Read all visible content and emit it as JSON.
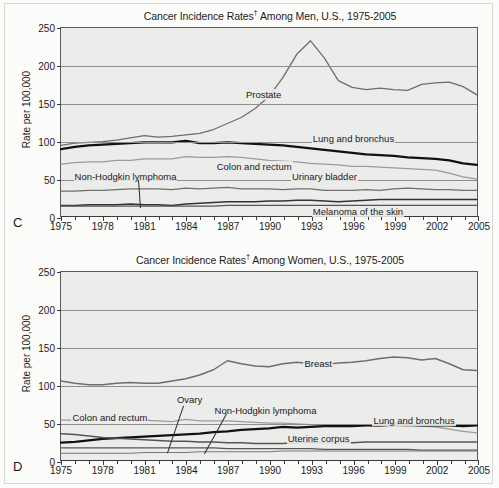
{
  "figure": {
    "background": "#fbfbfa",
    "plot_background": "#ececeb"
  },
  "panels": [
    {
      "panel_label": "C",
      "title_main": "Cancer Incidence Rates",
      "title_dagger": "†",
      "title_rest": " Among Men, U.S., 1975-2005",
      "ylabel": "Rate per 100,000"
    },
    {
      "panel_label": "D",
      "title_main": "Cancer Incidence Rates",
      "title_dagger": "†",
      "title_rest": " Among Women, U.S., 1975-2005",
      "ylabel": "Rate per 100,000"
    }
  ],
  "axis": {
    "yticks": [
      0,
      50,
      100,
      150,
      200,
      250
    ],
    "ylim": [
      0,
      250
    ],
    "xticks": [
      1975,
      1978,
      1981,
      1984,
      1987,
      1990,
      1993,
      1996,
      1999,
      2002,
      2005
    ],
    "xlim": [
      1975,
      2005
    ],
    "xminor_step": 1
  },
  "chart_data": [
    {
      "type": "line",
      "panel": "C",
      "title": "Cancer Incidence Rates† Among Men, U.S., 1975-2005",
      "xlabel": "",
      "ylabel": "Rate per 100,000",
      "xlim": [
        1975,
        2005
      ],
      "ylim": [
        0,
        250
      ],
      "grid": true,
      "legend": "inline-annotations",
      "x": [
        1975,
        1976,
        1977,
        1978,
        1979,
        1980,
        1981,
        1982,
        1983,
        1984,
        1985,
        1986,
        1987,
        1988,
        1989,
        1990,
        1991,
        1992,
        1993,
        1994,
        1995,
        1996,
        1997,
        1998,
        1999,
        2000,
        2001,
        2002,
        2003,
        2004,
        2005
      ],
      "series": [
        {
          "name": "Prostate",
          "color": "#6e6e6e",
          "width": 1.3,
          "values": [
            94,
            97,
            98,
            99,
            101,
            104,
            107,
            105,
            106,
            108,
            110,
            115,
            123,
            131,
            143,
            159,
            184,
            215,
            233,
            210,
            180,
            171,
            168,
            170,
            168,
            167,
            175,
            177,
            178,
            172,
            161
          ]
        },
        {
          "name": "Lung and bronchus",
          "color": "#111111",
          "width": 2.2,
          "values": [
            89,
            92,
            94,
            95,
            96,
            97,
            98,
            98,
            98,
            100,
            97,
            97,
            98,
            97,
            96,
            95,
            94,
            92,
            90,
            88,
            86,
            84,
            82,
            81,
            80,
            78,
            77,
            76,
            74,
            70,
            68
          ]
        },
        {
          "name": "Colon and rectum",
          "color": "#9a9a9a",
          "width": 1.3,
          "values": [
            69,
            71,
            72,
            72,
            74,
            74,
            76,
            76,
            76,
            79,
            78,
            78,
            79,
            78,
            76,
            74,
            73,
            72,
            70,
            69,
            68,
            66,
            66,
            65,
            64,
            63,
            62,
            61,
            57,
            52,
            49
          ]
        },
        {
          "name": "Urinary bladder",
          "color": "#6e6e6e",
          "width": 1.3,
          "values": [
            33,
            33,
            34,
            34,
            35,
            36,
            36,
            36,
            35,
            37,
            36,
            37,
            38,
            36,
            36,
            36,
            35,
            36,
            36,
            34,
            34,
            34,
            35,
            34,
            36,
            37,
            36,
            35,
            35,
            34,
            34
          ]
        },
        {
          "name": "Melanoma of the skin",
          "color": "#333333",
          "width": 1.6,
          "values": [
            14,
            14,
            15,
            15,
            15,
            16,
            15,
            15,
            14,
            16,
            17,
            18,
            19,
            19,
            19,
            20,
            20,
            21,
            21,
            20,
            19,
            20,
            21,
            22,
            22,
            22,
            22,
            22,
            22,
            22,
            22
          ]
        },
        {
          "name": "Non-Hodgkin lymphoma",
          "color": "#555555",
          "width": 1.2,
          "values": [
            13,
            13,
            13,
            13,
            13,
            13,
            13,
            13,
            13,
            13,
            13,
            13,
            14,
            14,
            14,
            14,
            14,
            14,
            14,
            14,
            14,
            14,
            14,
            14,
            14,
            14,
            14,
            14,
            14,
            14,
            14
          ]
        }
      ],
      "annotations": [
        {
          "text": "Prostate",
          "x_frac": 0.44,
          "y_frac": 0.32
        },
        {
          "text": "Lung and bronchus",
          "x_frac": 0.6,
          "y_frac": 0.555
        },
        {
          "text": "Colon and rectum",
          "x_frac": 0.37,
          "y_frac": 0.7
        },
        {
          "text": "Non-Hodgkin lymphoma",
          "x_frac": 0.03,
          "y_frac": 0.755
        },
        {
          "text": "Urinary bladder",
          "x_frac": 0.55,
          "y_frac": 0.755
        },
        {
          "text": "Melanoma of the skin",
          "x_frac": 0.6,
          "y_frac": 0.935
        }
      ]
    },
    {
      "type": "line",
      "panel": "D",
      "title": "Cancer Incidence Rates† Among Women, U.S., 1975-2005",
      "xlabel": "",
      "ylabel": "Rate per 100,000",
      "xlim": [
        1975,
        2005
      ],
      "ylim": [
        0,
        250
      ],
      "grid": true,
      "legend": "inline-annotations",
      "x": [
        1975,
        1976,
        1977,
        1978,
        1979,
        1980,
        1981,
        1982,
        1983,
        1984,
        1985,
        1986,
        1987,
        1988,
        1989,
        1990,
        1991,
        1992,
        1993,
        1994,
        1995,
        1996,
        1997,
        1998,
        1999,
        2000,
        2001,
        2002,
        2003,
        2004,
        2005
      ],
      "series": [
        {
          "name": "Breast",
          "color": "#6e6e6e",
          "width": 1.4,
          "values": [
            105,
            102,
            100,
            100,
            102,
            103,
            102,
            102,
            105,
            108,
            113,
            120,
            132,
            128,
            125,
            124,
            128,
            130,
            128,
            127,
            129,
            130,
            132,
            135,
            137,
            136,
            133,
            135,
            128,
            120,
            119
          ]
        },
        {
          "name": "Colon and rectum",
          "color": "#9a9a9a",
          "width": 1.3,
          "values": [
            53,
            53,
            53,
            53,
            54,
            53,
            53,
            52,
            51,
            54,
            52,
            52,
            52,
            51,
            50,
            49,
            49,
            48,
            47,
            46,
            46,
            45,
            46,
            45,
            46,
            45,
            45,
            44,
            41,
            38,
            36
          ]
        },
        {
          "name": "Lung and bronchus",
          "color": "#111111",
          "width": 2.2,
          "values": [
            23,
            24,
            26,
            28,
            29,
            30,
            31,
            32,
            33,
            34,
            35,
            37,
            38,
            40,
            41,
            42,
            44,
            43,
            44,
            45,
            45,
            45,
            46,
            46,
            47,
            47,
            46,
            46,
            46,
            45,
            46
          ]
        },
        {
          "name": "Ovary",
          "color": "#555555",
          "width": 1.2,
          "values": [
            16,
            16,
            16,
            16,
            16,
            16,
            16,
            16,
            16,
            16,
            16,
            16,
            15,
            15,
            15,
            15,
            15,
            15,
            15,
            14,
            14,
            14,
            14,
            14,
            14,
            14,
            13,
            13,
            13,
            13,
            13
          ]
        },
        {
          "name": "Uterine corpus",
          "color": "#555555",
          "width": 1.4,
          "values": [
            35,
            34,
            32,
            30,
            29,
            28,
            27,
            26,
            25,
            25,
            24,
            24,
            23,
            23,
            22,
            22,
            22,
            23,
            23,
            23,
            23,
            23,
            24,
            24,
            24,
            24,
            24,
            24,
            24,
            24,
            24
          ]
        },
        {
          "name": "Non-Hodgkin lymphoma",
          "color": "#777777",
          "width": 1.2,
          "values": [
            9,
            9,
            9,
            9,
            9,
            9,
            10,
            10,
            10,
            10,
            11,
            11,
            11,
            11,
            11,
            11,
            12,
            12,
            12,
            12,
            12,
            12,
            12,
            12,
            12,
            12,
            12,
            12,
            12,
            12,
            12
          ]
        }
      ],
      "annotations": [
        {
          "text": "Breast",
          "x_frac": 0.58,
          "y_frac": 0.455
        },
        {
          "text": "Ovary",
          "x_frac": 0.275,
          "y_frac": 0.64
        },
        {
          "text": "Non-Hodgkin lymphoma",
          "x_frac": 0.365,
          "y_frac": 0.7
        },
        {
          "text": "Colon and rectum",
          "x_frac": 0.025,
          "y_frac": 0.735
        },
        {
          "text": "Lung and bronchus",
          "x_frac": 0.745,
          "y_frac": 0.755
        },
        {
          "text": "Uterine corpus",
          "x_frac": 0.54,
          "y_frac": 0.845
        }
      ]
    }
  ]
}
